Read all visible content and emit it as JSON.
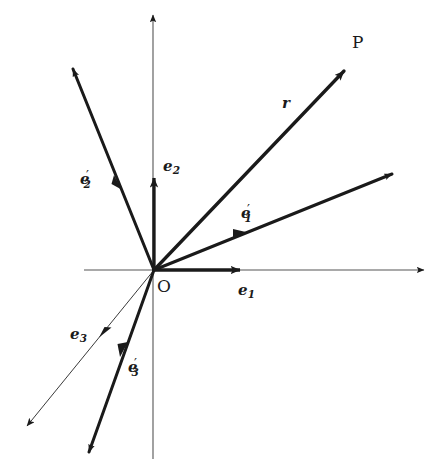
{
  "figure": {
    "background_color": "#ffffff",
    "ink_color": "#1a1a1a",
    "width": 442,
    "height": 465
  },
  "axes": {
    "origin": {
      "x": 154,
      "y": 270
    },
    "x_axis": {
      "x1": 84,
      "y1": 270,
      "x2": 424,
      "y2": 270,
      "arrow": "end",
      "stroke_width": 1.1
    },
    "y_axis": {
      "x1": 153,
      "y1": 459,
      "x2": 153,
      "y2": 15,
      "arrow": "end",
      "stroke_width": 1.1
    }
  },
  "labels": {
    "origin": "O",
    "point_p": "P",
    "r": "r",
    "e1": {
      "base": "e",
      "sub": "1",
      "prime": ""
    },
    "e2": {
      "base": "e",
      "sub": "2",
      "prime": ""
    },
    "e3": {
      "base": "e",
      "sub": "3",
      "prime": ""
    },
    "e1p": {
      "base": "e",
      "sub": "1",
      "prime": "′"
    },
    "e2p": {
      "base": "e",
      "sub": "2",
      "prime": "′"
    },
    "e3p": {
      "base": "e",
      "sub": "3",
      "prime": "′"
    }
  },
  "label_positions": {
    "origin": {
      "x": 157,
      "y": 278
    },
    "point_p": {
      "x": 352,
      "y": 34
    },
    "r": {
      "x": 282,
      "y": 96
    },
    "e1": {
      "x": 238,
      "y": 283
    },
    "e2": {
      "x": 163,
      "y": 159
    },
    "e3": {
      "x": 70,
      "y": 327
    },
    "e1p": {
      "x": 241,
      "y": 203
    },
    "e2p": {
      "x": 80,
      "y": 169
    },
    "e3p": {
      "x": 128,
      "y": 357
    }
  },
  "vectors": [
    {
      "name": "r",
      "label": "r",
      "from": {
        "x": 154,
        "y": 270
      },
      "to": {
        "x": 348,
        "y": 67
      },
      "stroke_width": 3.2,
      "thick": true,
      "arrow": "end",
      "mid_arrow": false,
      "description": "position vector from origin O to point P"
    },
    {
      "name": "e1-prime-ray",
      "label": "e1'",
      "from": {
        "x": 154,
        "y": 270
      },
      "to": {
        "x": 396,
        "y": 172
      },
      "stroke_width": 3.0,
      "thick": true,
      "arrow": "end-small",
      "mid_arrow": true,
      "mid_arrow_at": {
        "x": 241,
        "y": 234
      },
      "description": "primed first basis direction, oblique, pointing up-right"
    },
    {
      "name": "e2-prime-ray",
      "label": "e2'",
      "from": {
        "x": 154,
        "y": 270
      },
      "to": {
        "x": 71,
        "y": 65
      },
      "stroke_width": 3.0,
      "thick": true,
      "arrow": "end-small",
      "mid_arrow": true,
      "mid_arrow_at": {
        "x": 118,
        "y": 183
      },
      "description": "primed second basis direction, oblique, pointing up-left"
    },
    {
      "name": "e3-prime-ray",
      "label": "e3'",
      "from": {
        "x": 154,
        "y": 270
      },
      "to": {
        "x": 87,
        "y": 457
      },
      "stroke_width": 3.0,
      "thick": true,
      "arrow": "end-small",
      "mid_arrow": true,
      "mid_arrow_at": {
        "x": 123,
        "y": 351
      },
      "description": "primed third basis direction, oblique, pointing down-left"
    },
    {
      "name": "e3-ray",
      "label": "e3",
      "from": {
        "x": 154,
        "y": 270
      },
      "to": {
        "x": 25,
        "y": 428
      },
      "stroke_width": 1.0,
      "thick": false,
      "arrow": "end-small",
      "mid_arrow": true,
      "mid_arrow_at": {
        "x": 104,
        "y": 334
      },
      "description": "unprimed third basis direction, thin line pointing down-left"
    },
    {
      "name": "e1-unit",
      "label": "e1",
      "from": {
        "x": 154,
        "y": 270
      },
      "to": {
        "x": 246,
        "y": 270
      },
      "stroke_width": 3.2,
      "thick": true,
      "arrow": "end",
      "mid_arrow": false,
      "description": "unprimed first basis unit vector along positive x axis"
    },
    {
      "name": "e2-unit",
      "label": "e2",
      "from": {
        "x": 154,
        "y": 270
      },
      "to": {
        "x": 154,
        "y": 171
      },
      "stroke_width": 3.2,
      "thick": true,
      "arrow": "end",
      "mid_arrow": false,
      "description": "unprimed second basis unit vector along positive y axis"
    }
  ]
}
